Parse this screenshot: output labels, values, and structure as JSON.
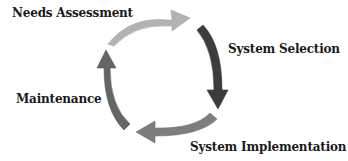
{
  "diagram": {
    "type": "cycle",
    "stages": [
      {
        "id": "needs-assessment",
        "label": "Needs Assessment",
        "arrow_color": "#b3b3b3"
      },
      {
        "id": "system-selection",
        "label": "System Selection",
        "arrow_color": "#3c3c3c"
      },
      {
        "id": "system-implementation",
        "label": "System Implementation",
        "arrow_color": "#7d7d7d"
      },
      {
        "id": "maintenance",
        "label": "Maintenance",
        "arrow_color": "#656565"
      }
    ],
    "direction": "clockwise"
  }
}
